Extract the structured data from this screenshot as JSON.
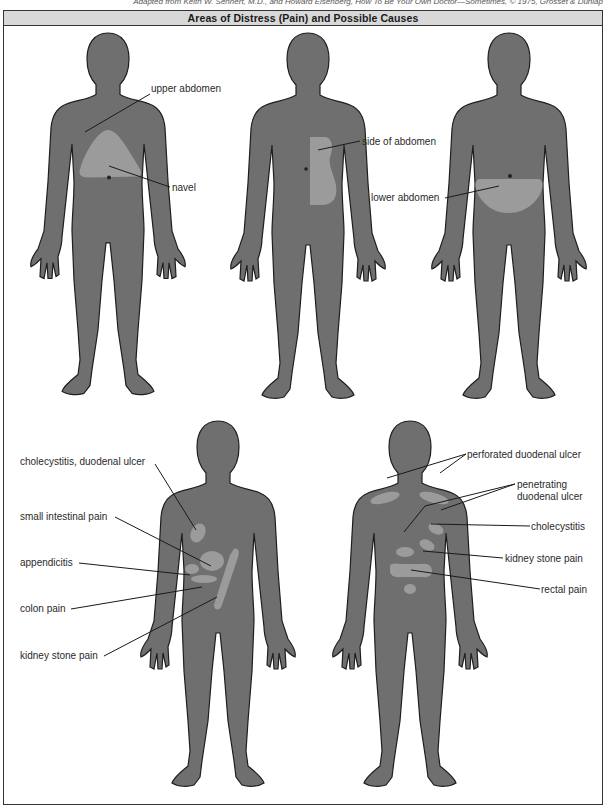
{
  "credit": "Adapted from Keith W. Sehnert, M.D., and Howard Eisenberg, How To Be Your Own Doctor—Sometimes, © 1975, Grosset & Dunlap",
  "title": "Areas of Distress (Pain) and Possible Causes",
  "colors": {
    "body_fill": "#6f6f6f",
    "body_outline": "#1e1e1e",
    "pain_area": "#9b9b9b",
    "title_bg": "#d8d8d8",
    "leader_line": "#1a1a1a"
  },
  "figures": [
    {
      "id": "front-1",
      "view": "front",
      "labels": [
        {
          "text": "upper abdomen"
        },
        {
          "text": "navel"
        }
      ]
    },
    {
      "id": "front-2",
      "view": "front",
      "labels": [
        {
          "text": "side of abdomen"
        }
      ]
    },
    {
      "id": "front-3",
      "view": "front",
      "labels": [
        {
          "text": "lower abdomen"
        }
      ]
    },
    {
      "id": "front-4",
      "view": "front",
      "labels": [
        {
          "text": "cholecystitis, duodenal ulcer"
        },
        {
          "text": "small intestinal pain"
        },
        {
          "text": "appendicitis"
        },
        {
          "text": "colon pain"
        },
        {
          "text": "kidney stone pain"
        }
      ]
    },
    {
      "id": "back-5",
      "view": "back",
      "labels": [
        {
          "text": "perforated duodenal ulcer"
        },
        {
          "text": "penetrating"
        },
        {
          "text": "duodenal ulcer"
        },
        {
          "text": "cholecystitis"
        },
        {
          "text": "kidney stone pain"
        },
        {
          "text": "rectal pain"
        }
      ]
    }
  ]
}
